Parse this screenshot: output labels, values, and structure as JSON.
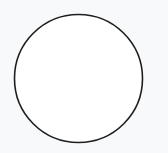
{
  "canvas": {
    "width": 168,
    "height": 153,
    "background": "#f7f9fb"
  },
  "shapes": [
    {
      "type": "circle",
      "cx": 78.5,
      "cy": 78.5,
      "r": 64,
      "fill": "#ffffff",
      "stroke": "#1f1f1f",
      "stroke_width": 1.6
    }
  ]
}
